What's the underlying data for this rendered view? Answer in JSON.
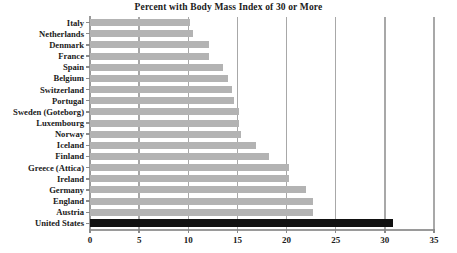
{
  "chart_data": {
    "type": "bar",
    "orientation": "horizontal",
    "title": "Percent with Body Mass Index of 30 or More",
    "xlabel": "",
    "ylabel": "",
    "xlim": [
      0,
      35
    ],
    "xticks": [
      0,
      5,
      10,
      15,
      20,
      25,
      30,
      35
    ],
    "xtick_labels": [
      "0",
      "5",
      "10",
      "15",
      "20",
      "25",
      "30",
      "35"
    ],
    "grid": true,
    "grid_axis": "x",
    "legend": false,
    "bar_color": "#b3b3b3",
    "highlight_color": "#111111",
    "highlight_category": "United States",
    "categories": [
      "Italy",
      "Netherlands",
      "Denmark",
      "France",
      "Spain",
      "Belgium",
      "Switzerland",
      "Portugal",
      "Sweden (Goteborg)",
      "Luxembourg",
      "Norway",
      "Iceland",
      "Finland",
      "Greece (Attica)",
      "Ireland",
      "Germany",
      "England",
      "Austria",
      "United States"
    ],
    "values": [
      10.2,
      10.5,
      12.1,
      12.1,
      13.5,
      14.0,
      14.4,
      14.7,
      15.2,
      15.2,
      15.4,
      16.9,
      18.2,
      20.2,
      20.2,
      22.0,
      22.7,
      22.7,
      30.8
    ]
  }
}
